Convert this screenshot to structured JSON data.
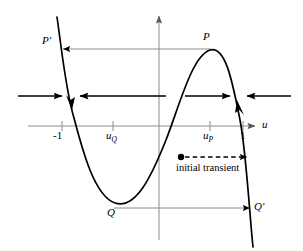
{
  "figure": {
    "type": "phase-line-diagram",
    "colors": {
      "curve": "#000000",
      "axis": "#8c8c8c",
      "leader_line": "#8c8c8c",
      "arrow": "#000000",
      "text": "#000000",
      "background": "#ffffff"
    }
  },
  "axes": {
    "x_axis_label": "u",
    "x_ticks": [
      {
        "id": "minus-one",
        "label": "-1",
        "x": 62
      },
      {
        "id": "u-Q",
        "label": "u",
        "sub": "Q",
        "x": 113
      },
      {
        "id": "u-P",
        "label": "u",
        "sub": "P",
        "x": 210
      },
      {
        "id": "one",
        "label": "1",
        "x": 243
      }
    ],
    "x_axis_y": 126,
    "y_axis_x": 159
  },
  "point_labels": [
    {
      "id": "P-prime",
      "label": "P",
      "prime": true,
      "x": 44,
      "y": 40
    },
    {
      "id": "P",
      "label": "P",
      "prime": false,
      "x": 203,
      "y": 36
    },
    {
      "id": "Q",
      "label": "Q",
      "prime": false,
      "x": 108,
      "y": 210
    },
    {
      "id": "Q-prime",
      "label": "Q",
      "prime": true,
      "x": 256,
      "y": 203
    }
  ],
  "annotations": {
    "initial_transient": {
      "text": "initial transient",
      "dot_x": 181,
      "dot_y": 157,
      "arrow_end_x": 248,
      "text_x": 176,
      "text_y": 164
    }
  },
  "flow_arrows": [
    {
      "id": "flow-1",
      "direction": "right",
      "x_start": 18,
      "x_end": 63,
      "y": 96
    },
    {
      "id": "flow-2",
      "direction": "left",
      "x_start": 166,
      "x_end": 79,
      "y": 96
    },
    {
      "id": "flow-3",
      "direction": "right",
      "x_start": 185,
      "x_end": 231,
      "y": 96
    },
    {
      "id": "flow-4",
      "direction": "left",
      "x_start": 291,
      "x_end": 246,
      "y": 96
    }
  ],
  "curve_arrows": [
    {
      "id": "curve-arrow-down-left-branch",
      "direction": "down",
      "x": 70,
      "y": 104
    },
    {
      "id": "curve-arrow-up-right-branch",
      "direction": "up",
      "x": 240,
      "y": 103
    }
  ],
  "leader_lines": [
    {
      "id": "P-to-P-prime",
      "y": 49,
      "x_start": 211,
      "x_end": 62,
      "arrow": "left"
    },
    {
      "id": "Q-to-Q-prime",
      "y": 208,
      "x_start": 114,
      "x_end": 251,
      "arrow": "right"
    }
  ]
}
